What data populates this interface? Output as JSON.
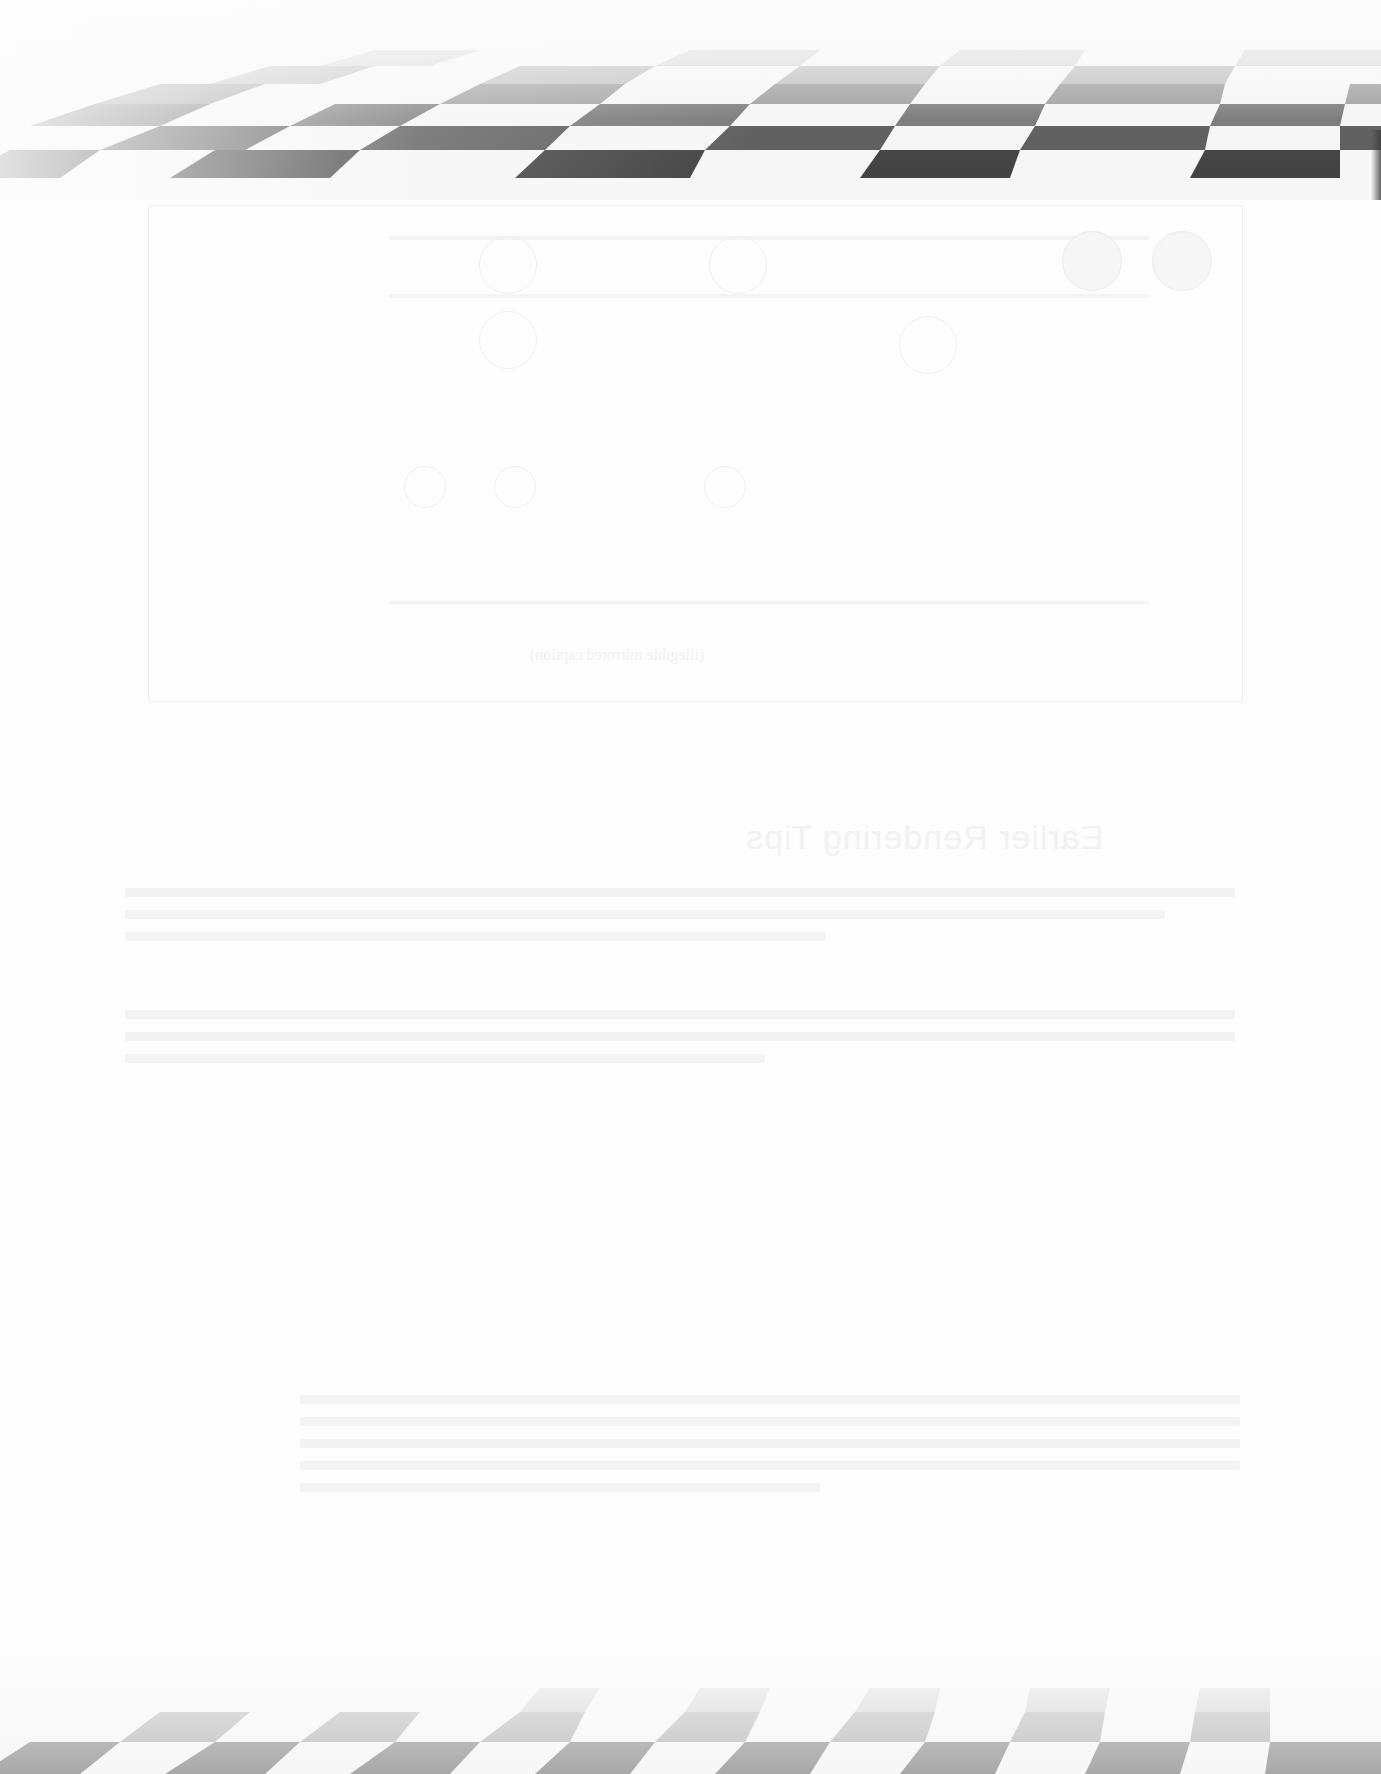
{
  "page": {
    "type": "scanned-page-reverse-side",
    "background_color": "#fdfdfd"
  },
  "decorations": {
    "top_band": {
      "pattern": "perspective-checkerboard",
      "dark_color": "#555555",
      "light_color": "#f4f4f4"
    },
    "bottom_band": {
      "pattern": "perspective-checkerboard",
      "dark_color": "#aaaaaa",
      "light_color": "#f6f6f6"
    }
  },
  "bleed_through": {
    "figure_caption": "(illegible mirrored caption)",
    "section_heading": "Earlier Rendering Tips",
    "paragraphs": [
      "(illegible bleed-through text)",
      "(illegible bleed-through text)",
      "(illegible bleed-through text)"
    ]
  }
}
